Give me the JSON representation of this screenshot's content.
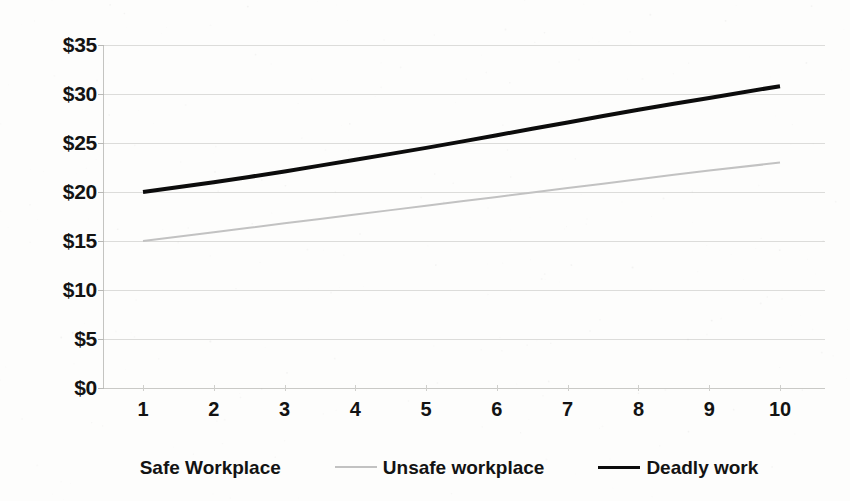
{
  "chart_data": {
    "type": "line",
    "title": "",
    "subtitle": "",
    "xlabel": "",
    "ylabel": "",
    "x": [
      1,
      2,
      3,
      4,
      5,
      6,
      7,
      8,
      9,
      10
    ],
    "xlim": [
      1,
      10
    ],
    "ylim": [
      0,
      35
    ],
    "grid": true,
    "legend_position": "bottom",
    "x_tick_labels": [
      "1",
      "2",
      "3",
      "4",
      "5",
      "6",
      "7",
      "8",
      "9",
      "10"
    ],
    "y_tick_labels": [
      "$0",
      "$5",
      "$10",
      "$15",
      "$20",
      "$25",
      "$30",
      "$35"
    ],
    "y_tick_values": [
      0,
      5,
      10,
      15,
      20,
      25,
      30,
      35
    ],
    "series": [
      {
        "name": "Safe Workplace",
        "color": "#ffffff",
        "visible": false,
        "line_width": 0,
        "values": [
          null,
          null,
          null,
          null,
          null,
          null,
          null,
          null,
          null,
          null
        ]
      },
      {
        "name": "Unsafe workplace",
        "color": "#c2c2c2",
        "visible": true,
        "line_width": 2,
        "values": [
          15.0,
          15.9,
          16.8,
          17.7,
          18.6,
          19.5,
          20.4,
          21.3,
          22.2,
          23.0
        ]
      },
      {
        "name": "Deadly work",
        "color": "#0c0c0c",
        "visible": true,
        "line_width": 4,
        "values": [
          20.0,
          21.0,
          22.1,
          23.3,
          24.5,
          25.8,
          27.1,
          28.4,
          29.6,
          30.8
        ]
      }
    ]
  },
  "legend": {
    "items": [
      {
        "label": "Safe Workplace",
        "marker": "none"
      },
      {
        "label": "Unsafe workplace",
        "marker": "line-gray"
      },
      {
        "label": "Deadly work",
        "marker": "line-black"
      }
    ]
  },
  "axes": {
    "y_labels": [
      "$35",
      "$30",
      "$25",
      "$20",
      "$15",
      "$10",
      "$5",
      "$0"
    ],
    "x_labels": [
      "1",
      "2",
      "3",
      "4",
      "5",
      "6",
      "7",
      "8",
      "9",
      "10"
    ]
  },
  "colors": {
    "background": "#fdfdfc",
    "gridline": "#dcdcda",
    "axis": "#c4c4c1",
    "text": "#131313",
    "series_gray": "#c2c2c2",
    "series_black": "#0c0c0c"
  }
}
